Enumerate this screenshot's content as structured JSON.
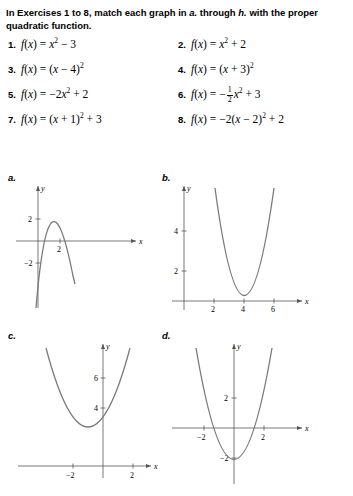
{
  "instructions": {
    "line_prefix": "In Exercises 1 to 8, match each graph in ",
    "ital_a": "a.",
    "mid": " through ",
    "ital_h": "h.",
    "line_suffix": " with the proper quadratic function."
  },
  "exercises": [
    {
      "num": "1.",
      "fn": "f(x) = x² − 3"
    },
    {
      "num": "2.",
      "fn": "f(x) = x² + 2"
    },
    {
      "num": "3.",
      "fn": "f(x) = (x − 4)²"
    },
    {
      "num": "4.",
      "fn": "f(x) = (x + 3)²"
    },
    {
      "num": "5.",
      "fn": "f(x) = −2x² + 2"
    },
    {
      "num": "6.",
      "fn": "f(x) = −1/2 x² + 3"
    },
    {
      "num": "7.",
      "fn": "f(x) = (x + 1)² + 3"
    },
    {
      "num": "8.",
      "fn": "f(x) = −2(x − 2)² + 2"
    }
  ],
  "graphs": [
    {
      "label": "a.",
      "axis_x_label": "x",
      "axis_y_label": "y",
      "x_ticks": [
        "2"
      ],
      "y_ticks": [
        "2",
        "−2"
      ],
      "curve": "downward parabola, vertex near (1, 2.4)"
    },
    {
      "label": "b.",
      "axis_x_label": "x",
      "axis_y_label": "y",
      "x_ticks": [
        "2",
        "4",
        "6"
      ],
      "y_ticks": [
        "2",
        "4"
      ],
      "curve": "upward parabola, vertex near (4, 0)"
    },
    {
      "label": "c.",
      "axis_x_label": "x",
      "axis_y_label": "y",
      "x_ticks": [
        "−2",
        "2"
      ],
      "y_ticks": [
        "4",
        "6"
      ],
      "curve": "upward parabola, vertex near (−1, 3)"
    },
    {
      "label": "d.",
      "axis_x_label": "x",
      "axis_y_label": "y",
      "x_ticks": [
        "−2",
        "2"
      ],
      "y_ticks": [
        "2",
        "−2"
      ],
      "curve": "upward parabola, vertex near (0, −3)"
    }
  ],
  "sidebar": {
    "lines": [
      "",
      "",
      "",
      ""
    ]
  },
  "colors": {
    "curve": "#7a7a7a",
    "axis": "#555555",
    "text": "#000000"
  }
}
